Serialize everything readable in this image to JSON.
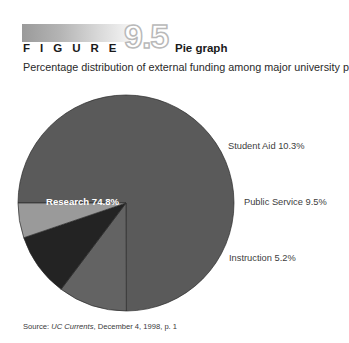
{
  "figure": {
    "label": "F I G U R E",
    "number": "9.5",
    "title": "Pie graph",
    "subtitle": "Percentage distribution of external funding among major university programs"
  },
  "source": {
    "prefix": "Source: ",
    "publication": "UC Currents",
    "rest": ", December 4, 1998, p. 1"
  },
  "labels": {
    "research": "Research 74.8%",
    "student_aid": "Student Aid 10.3%",
    "public_service": "Public Service 9.5%",
    "instruction": "Instruction 5.2%"
  },
  "colors": {
    "research": "#5a5a5a",
    "student_aid": "#636363",
    "public_service": "#232323",
    "instruction": "#9a9a9a",
    "outline": "#2b2b2b",
    "gradient_start": "#9a9a9a",
    "gradient_end": "#f4f4f4",
    "figure_number_stroke": "#b9b9b9"
  },
  "chart_data": {
    "type": "pie",
    "title": "Pie graph",
    "subtitle": "Percentage distribution of external funding among major university programs",
    "categories": [
      "Research",
      "Student Aid",
      "Public Service",
      "Instruction"
    ],
    "values": [
      74.8,
      10.3,
      9.5,
      5.2
    ],
    "unit": "percent",
    "labels": [
      "Research 74.8%",
      "Student Aid 10.3%",
      "Public Service 9.5%",
      "Instruction 5.2%"
    ],
    "colors": [
      "#5a5a5a",
      "#636363",
      "#232323",
      "#9a9a9a"
    ],
    "start_angle_deg": 180,
    "direction": "clockwise",
    "legend": "none",
    "label_placement": [
      "inside",
      "outside-right",
      "outside-right",
      "outside-right"
    ],
    "center_px": [
      126,
      119
    ],
    "radius_px": 108
  }
}
